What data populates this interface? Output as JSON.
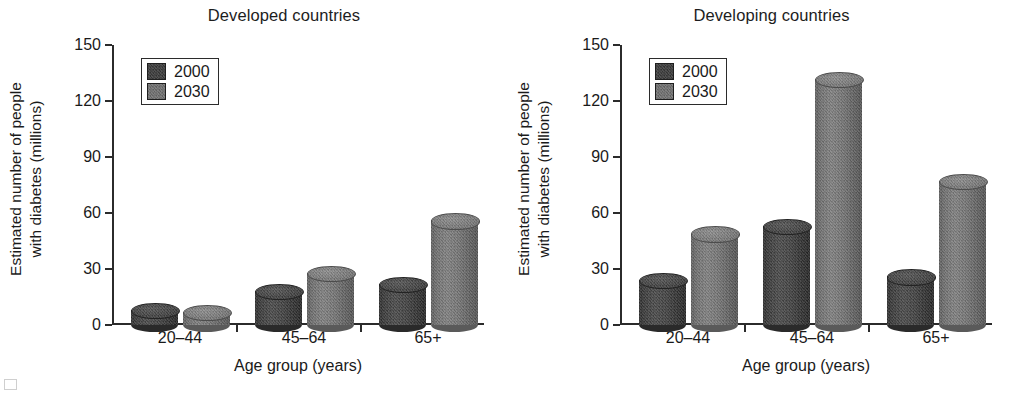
{
  "figure": {
    "background": "#ffffff",
    "caption_fragment": ""
  },
  "legend": {
    "entries": [
      {
        "label": "2000",
        "color": "#3a3a3a",
        "swatch": "swatch-2000"
      },
      {
        "label": "2030",
        "color": "#6f6f6f",
        "swatch": "swatch-2030"
      }
    ]
  },
  "axis": {
    "ylabel_line1": "Estimated number of people",
    "ylabel_line2": "with diabetes (millions)",
    "xlabel": "Age group (years)",
    "yticks": [
      "150",
      "120",
      "90",
      "60",
      "30",
      "0"
    ],
    "xticks": [
      "20–44",
      "45–64",
      "65+"
    ]
  },
  "panels": [
    {
      "id": "developed",
      "title": "Developed countries"
    },
    {
      "id": "developing",
      "title": "Developing countries"
    }
  ],
  "chart_data": [
    {
      "type": "bar",
      "title": "Developed countries",
      "xlabel": "Age group (years)",
      "ylabel": "Estimated number of people with diabetes (millions)",
      "categories": [
        "20–44",
        "45–64",
        "65+"
      ],
      "ylim": [
        0,
        150
      ],
      "yticks": [
        0,
        30,
        60,
        90,
        120,
        150
      ],
      "grid": false,
      "legend_position": "upper-left",
      "series": [
        {
          "name": "2000",
          "color": "#3a3a3a",
          "values": [
            8,
            18,
            22
          ]
        },
        {
          "name": "2030",
          "color": "#6f6f6f",
          "values": [
            7,
            28,
            56
          ]
        }
      ]
    },
    {
      "type": "bar",
      "title": "Developing countries",
      "xlabel": "Age group (years)",
      "ylabel": "Estimated number of people with diabetes (millions)",
      "categories": [
        "20–44",
        "45–64",
        "65+"
      ],
      "ylim": [
        0,
        150
      ],
      "yticks": [
        0,
        30,
        60,
        90,
        120,
        150
      ],
      "grid": false,
      "legend_position": "upper-left",
      "series": [
        {
          "name": "2000",
          "color": "#3a3a3a",
          "values": [
            24,
            53,
            26
          ]
        },
        {
          "name": "2030",
          "color": "#6f6f6f",
          "values": [
            49,
            132,
            77
          ]
        }
      ]
    }
  ]
}
